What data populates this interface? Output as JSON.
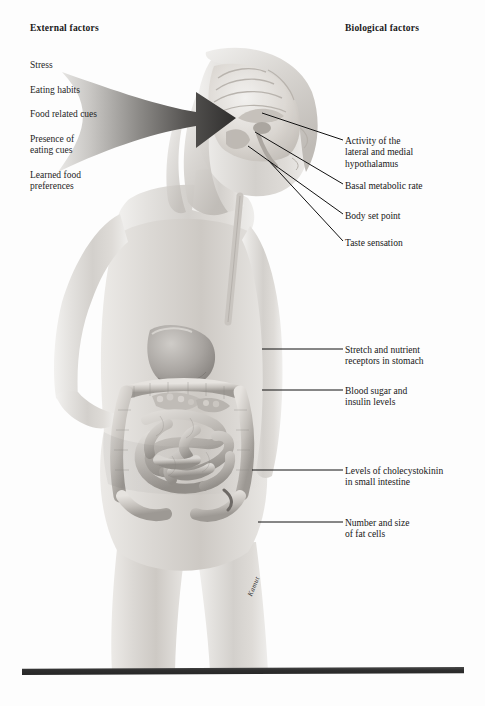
{
  "figure": {
    "title_left": "External factors",
    "title_right": "Biological factors",
    "background_color": "#fdfdfd",
    "ink_color": "#161616",
    "arrow_color": "#3a3a3a",
    "ground_bar_color": "#2e2e2e",
    "signature": "Kamut"
  },
  "external_factors": [
    {
      "label": "Stress"
    },
    {
      "label": "Eating habits"
    },
    {
      "label": "Food related cues"
    },
    {
      "label": "Presence of\neating cues"
    },
    {
      "label": "Learned food\npreferences"
    }
  ],
  "biological_factors": [
    {
      "label": "Activity of the\nlateral and medial\nhypothalamus",
      "x": 345,
      "y": 136
    },
    {
      "label": "Basal metabolic rate",
      "x": 345,
      "y": 181
    },
    {
      "label": "Body set point",
      "x": 345,
      "y": 211
    },
    {
      "label": "Taste sensation",
      "x": 345,
      "y": 238
    },
    {
      "label": "Stretch and nutrient\nreceptors in stomach",
      "x": 345,
      "y": 345
    },
    {
      "label": "Blood sugar and\ninsulin levels",
      "x": 345,
      "y": 386
    },
    {
      "label": "Levels of cholecystokinin\nin small intestine",
      "x": 345,
      "y": 466
    },
    {
      "label": "Number and size\nof fat cells",
      "x": 345,
      "y": 518
    }
  ],
  "leader_lines": [
    {
      "name": "hypothalamus",
      "x1": 262,
      "y1": 113,
      "x2": 343,
      "y2": 140
    },
    {
      "name": "basal-metabolic-rate",
      "x1": 255,
      "y1": 132,
      "x2": 343,
      "y2": 184
    },
    {
      "name": "body-set-point",
      "x1": 248,
      "y1": 146,
      "x2": 343,
      "y2": 214
    },
    {
      "name": "taste-sensation",
      "x1": 268,
      "y1": 160,
      "x2": 343,
      "y2": 241
    },
    {
      "name": "stomach-receptors",
      "x1": 262,
      "y1": 349,
      "x2": 343,
      "y2": 349
    },
    {
      "name": "blood-sugar",
      "x1": 262,
      "y1": 390,
      "x2": 343,
      "y2": 390
    },
    {
      "name": "cholecystokinin",
      "x1": 252,
      "y1": 470,
      "x2": 343,
      "y2": 470
    },
    {
      "name": "fat-cells",
      "x1": 258,
      "y1": 522,
      "x2": 343,
      "y2": 522
    }
  ],
  "anatomy_parts": [
    "brain-sagittal-section",
    "hypothalamus",
    "esophagus",
    "stomach",
    "pancreas",
    "large-intestine",
    "small-intestine",
    "appendix"
  ]
}
